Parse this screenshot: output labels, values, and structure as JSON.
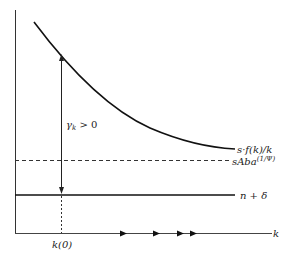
{
  "diagram": {
    "labels": {
      "savings_curve": "s·f(k)/k",
      "asymptote": "sAba",
      "asymptote_exp": "(1/Ψ)",
      "depreciation": "n + δ",
      "growth_rate": "γ",
      "growth_rate_sub": "k",
      "growth_rate_cond": " > 0",
      "initial_k": "k(0)",
      "x_axis": "k"
    },
    "colors": {
      "line": "#111111",
      "background": "#ffffff"
    }
  }
}
